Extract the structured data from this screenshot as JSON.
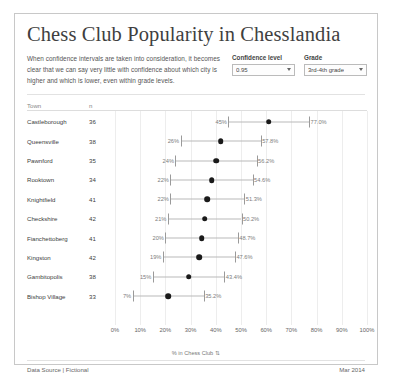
{
  "title": "Chess Club Popularity in Chesslandia",
  "intro": "When confidence intervals are taken into consideration, it becomes clear that we can say very little with confidence about which city is higher and which is lower, even within grade levels.",
  "controls": {
    "confidence": {
      "label": "Confidence level",
      "value": "0.95",
      "options": [
        "0.80",
        "0.90",
        "0.95",
        "0.99"
      ]
    },
    "grade": {
      "label": "Grade",
      "value": "3rd-4th grade",
      "options": [
        "1st-2nd grade",
        "3rd-4th grade",
        "5th-6th grade"
      ]
    }
  },
  "table": {
    "columns": [
      "Town",
      "n"
    ]
  },
  "footer": {
    "source": "Data Source | Fictional",
    "date": "Mar 2014"
  },
  "chart_data": {
    "type": "scatter",
    "title": "Chess Club Popularity in Chesslandia",
    "xlabel": "% in Chess Club",
    "ylabel": "Town",
    "xlim": [
      0,
      100
    ],
    "grid": true,
    "legend": "none",
    "axis_icon": "sort-icon",
    "ticks": [
      "0%",
      "10%",
      "20%",
      "30%",
      "40%",
      "50%",
      "60%",
      "70%",
      "80%",
      "90%",
      "100%"
    ],
    "tick_values": [
      0,
      10,
      20,
      30,
      40,
      50,
      60,
      70,
      80,
      90,
      100
    ],
    "categories": [
      "Castleborough",
      "Queensville",
      "Pawnford",
      "Rooktown",
      "Knightfield",
      "Checkshire",
      "Fianchettoberg",
      "Kingston",
      "Gambitopolis",
      "Bishop Village"
    ],
    "n": [
      36,
      38,
      35,
      34,
      41,
      42,
      41,
      42,
      38,
      33
    ],
    "points": [
      {
        "town": "Castleborough",
        "n": 36,
        "value": 61.0,
        "low": 45.0,
        "high": 77.0,
        "low_label": "45%",
        "high_label": "77.0%"
      },
      {
        "town": "Queensville",
        "n": 38,
        "value": 41.9,
        "low": 26.0,
        "high": 57.8,
        "low_label": "26%",
        "high_label": "57.8%"
      },
      {
        "town": "Pawnford",
        "n": 35,
        "value": 40.1,
        "low": 24.0,
        "high": 56.2,
        "low_label": "24%",
        "high_label": "56.2%"
      },
      {
        "town": "Rooktown",
        "n": 34,
        "value": 38.3,
        "low": 22.0,
        "high": 54.6,
        "low_label": "22%",
        "high_label": "54.6%"
      },
      {
        "town": "Knightfield",
        "n": 41,
        "value": 36.7,
        "low": 22.0,
        "high": 51.3,
        "low_label": "22%",
        "high_label": "51.3%"
      },
      {
        "town": "Checkshire",
        "n": 42,
        "value": 35.6,
        "low": 21.0,
        "high": 50.2,
        "low_label": "21%",
        "high_label": "50.2%"
      },
      {
        "town": "Fianchettoberg",
        "n": 41,
        "value": 34.4,
        "low": 20.0,
        "high": 48.7,
        "low_label": "20%",
        "high_label": "48.7%"
      },
      {
        "town": "Kingston",
        "n": 42,
        "value": 33.3,
        "low": 19.0,
        "high": 47.6,
        "low_label": "19%",
        "high_label": "47.6%"
      },
      {
        "town": "Gambitopolis",
        "n": 38,
        "value": 29.2,
        "low": 15.0,
        "high": 43.4,
        "low_label": "15%",
        "high_label": "43.4%"
      },
      {
        "town": "Bishop Village",
        "n": 33,
        "value": 21.1,
        "low": 7.0,
        "high": 35.2,
        "low_label": "7%",
        "high_label": "35.2%"
      }
    ]
  }
}
